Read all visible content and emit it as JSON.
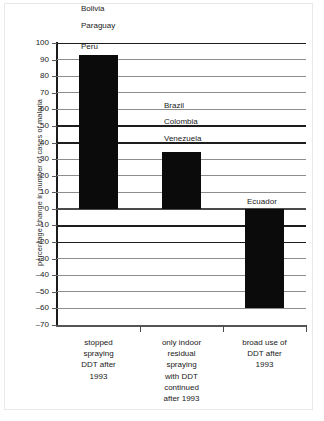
{
  "figure": {
    "ylabel": "percentage change in number of cases of malaria"
  },
  "chart_data": {
    "type": "bar",
    "title": "",
    "subtitle": "",
    "xlabel": "",
    "ylabel": "percentage change in number of cases of malaria",
    "ylim": [
      -70,
      100
    ],
    "ytick_step": 10,
    "grid": true,
    "legend": null,
    "categories": [
      "stopped spraying DDT after 1993",
      "only indoor residual spraying with DDT continued after 1993",
      "broad use of DDT after 1993"
    ],
    "values": [
      93,
      34,
      -60
    ],
    "yticks": [
      100,
      90,
      80,
      70,
      60,
      50,
      40,
      30,
      20,
      10,
      0,
      -10,
      -20,
      -30,
      -40,
      -50,
      -60,
      -70
    ],
    "ytick_labels": [
      "100",
      "90",
      "80",
      "70",
      "60",
      "50",
      "40",
      "30",
      "20",
      "10",
      "0",
      "–10",
      "–20",
      "–30",
      "–40",
      "–50",
      "–60",
      "–70"
    ],
    "annotations": [
      {
        "text": "Bolivia",
        "value": 120,
        "group": 0
      },
      {
        "text": "Paraguay",
        "value": 110,
        "group": 0
      },
      {
        "text": "Peru",
        "value": 97,
        "group": 0
      },
      {
        "text": "Brazil",
        "value": 62,
        "group": 1
      },
      {
        "text": "Colombia",
        "value": 52,
        "group": 1
      },
      {
        "text": "Venezuela",
        "value": 42,
        "group": 1
      },
      {
        "text": "Ecuador",
        "value": 4,
        "group": 2
      }
    ]
  },
  "xaxis": {
    "categories": [
      {
        "lines": [
          "stopped",
          "spraying",
          "DDT after",
          "1993"
        ]
      },
      {
        "lines": [
          "only indoor",
          "residual",
          "spraying",
          "with DDT",
          "continued",
          "after 1993"
        ]
      },
      {
        "lines": [
          "broad use of",
          "DDT after",
          "1993"
        ]
      }
    ]
  },
  "colors": {
    "bar": "#0b0b0b",
    "grid": "#8d8d8d",
    "axis": "#1a1a1a",
    "background": "#ffffff",
    "text": "#1a1a1a"
  }
}
